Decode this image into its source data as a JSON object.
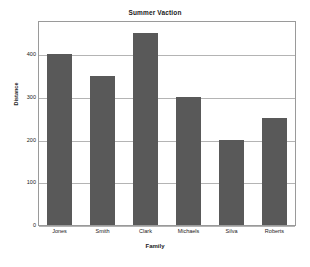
{
  "chart_data": {
    "type": "bar",
    "title": "Summer Vaction",
    "xlabel": "Family",
    "ylabel": "Distance",
    "categories": [
      "Jones",
      "Smith",
      "Clark",
      "Michaels",
      "Silva",
      "Roberts"
    ],
    "values": [
      400,
      350,
      450,
      300,
      200,
      250
    ],
    "yticks": [
      0,
      100,
      200,
      300,
      400
    ],
    "ytick_labels": [
      "0",
      "100",
      "200",
      "300",
      "400"
    ],
    "ylim": [
      0,
      480
    ],
    "grid": true,
    "grid_axis": "y",
    "legend": false,
    "bar_color": "#595959",
    "gridline_color": "#b4b4b4",
    "plot_border_color": "#9a9a9a",
    "background_color": "#ffffff"
  }
}
